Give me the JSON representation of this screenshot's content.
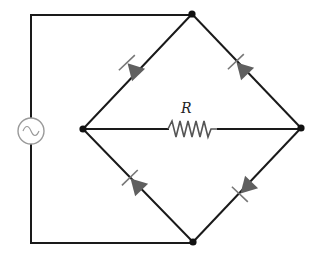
{
  "diagram": {
    "type": "circuit-schematic",
    "colors": {
      "wire": "#1a1a1a",
      "node": "#111111",
      "diode_fill": "#5f5f5f",
      "diode_bar": "#777777",
      "source_stroke": "#9a9a9a",
      "resistor_stroke": "#555555"
    },
    "nodes": [
      {
        "id": "top",
        "x": 192,
        "y": 14
      },
      {
        "id": "left",
        "x": 83,
        "y": 129
      },
      {
        "id": "right",
        "x": 301,
        "y": 128
      },
      {
        "id": "bottom",
        "x": 193,
        "y": 242
      }
    ],
    "components": {
      "source": {
        "symbol": "ac-source-icon",
        "glyph": "~",
        "cx": 31,
        "cy": 131,
        "r": 13
      },
      "resistor": {
        "label": "R",
        "from": "left",
        "to": "right",
        "x1": 168,
        "x2": 218,
        "y": 129
      },
      "diodes": [
        {
          "id": "D1",
          "position": "upper-left",
          "anode": "top",
          "cathode": "left"
        },
        {
          "id": "D2",
          "position": "upper-right",
          "anode": "right",
          "cathode": "top"
        },
        {
          "id": "D3",
          "position": "lower-left",
          "anode": "bottom",
          "cathode": "left"
        },
        {
          "id": "D4",
          "position": "lower-right",
          "anode": "right",
          "cathode": "bottom"
        }
      ]
    }
  }
}
